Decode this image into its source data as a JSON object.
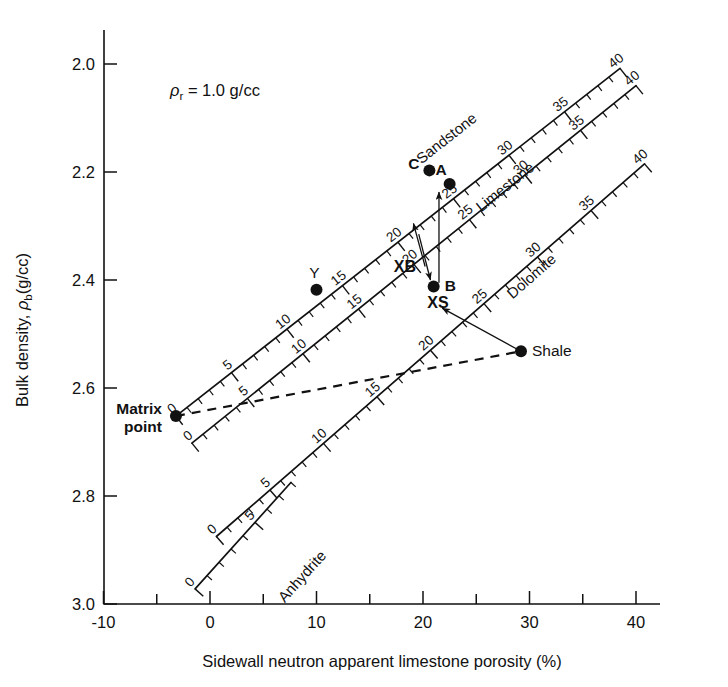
{
  "figure": {
    "domain": "chart",
    "background": "#ffffff",
    "ink_color": "#111111"
  },
  "chart_data": {
    "type": "scatter",
    "title": "",
    "xlabel": "Sidewall neutron apparent limestone porosity (%)",
    "ylabel": "Bulk density, ρb(g/cc)",
    "ylabel_parts": {
      "prefix": "Bulk density, ",
      "rho": "ρ",
      "sub": "b",
      "unit": "(g/cc)"
    },
    "xlim": [
      -10,
      45
    ],
    "ylim": [
      3.0,
      1.93
    ],
    "xticks": [
      -10,
      0,
      10,
      20,
      30,
      40
    ],
    "xtick_labels": [
      "-10",
      "0",
      "10",
      "20",
      "30",
      "40"
    ],
    "xminor_step": 5,
    "yticks": [
      2.0,
      2.2,
      2.4,
      2.6,
      2.8,
      3.0
    ],
    "ytick_labels": [
      "2.0",
      "2.2",
      "2.4",
      "2.6",
      "2.8",
      "3.0"
    ],
    "grid": false,
    "legend": "none",
    "annotations": [
      {
        "id": "fluid-density",
        "text": "ρr = 1.0 g/cc",
        "parts": {
          "rho": "ρ",
          "sub": "r",
          "rest": "= 1.0 g/cc"
        },
        "x": -2.0,
        "y": 2.085
      }
    ],
    "lithology_lines": [
      {
        "name": "Sandstone",
        "label_pos": {
          "x": 22.5,
          "y": 2.145
        },
        "label_rotation": -38,
        "start": {
          "x": -3.2,
          "y": 2.652
        },
        "end": {
          "x": 38.5,
          "y": 2.008
        },
        "scale_min": 0,
        "scale_max": 40,
        "major_step": 5,
        "minor_step": 1,
        "major_labels": [
          0,
          5,
          10,
          15,
          20,
          25,
          30,
          35,
          40
        ]
      },
      {
        "name": "Limestone",
        "label_pos": {
          "x": 28.0,
          "y": 2.235
        },
        "label_rotation": -38,
        "start": {
          "x": -1.7,
          "y": 2.702
        },
        "end": {
          "x": 40.0,
          "y": 2.04
        },
        "scale_min": 0,
        "scale_max": 40,
        "major_step": 5,
        "minor_step": 1,
        "major_labels": [
          0,
          5,
          10,
          15,
          20,
          25,
          30,
          35,
          40
        ]
      },
      {
        "name": "Dolomite",
        "label_pos": {
          "x": 30.5,
          "y": 2.4
        },
        "label_rotation": -38,
        "start": {
          "x": 0.6,
          "y": 2.875
        },
        "end": {
          "x": 40.8,
          "y": 2.185
        },
        "scale_min": 0,
        "scale_max": 40,
        "major_step": 5,
        "minor_step": 1,
        "major_labels": [
          0,
          5,
          10,
          15,
          20,
          25,
          30,
          35,
          40
        ]
      },
      {
        "name": "Anhydrite",
        "label_pos": {
          "x": 9.0,
          "y": 2.955
        },
        "label_rotation": -38,
        "start": {
          "x": -1.4,
          "y": 2.972
        },
        "end": {
          "x": 7.6,
          "y": 2.775
        },
        "scale_min": 0,
        "scale_max": 8,
        "major_step": 5,
        "minor_step": 1,
        "major_labels": [
          0,
          5
        ]
      }
    ],
    "points": [
      {
        "id": "matrix-point",
        "label": "Matrix\npoint",
        "label_line1": "Matrix",
        "label_line2": "point",
        "x": -3.2,
        "y": 2.652,
        "label_side": "left"
      },
      {
        "id": "point-Y",
        "label": "Y",
        "x": 10.0,
        "y": 2.418,
        "label_side": "above"
      },
      {
        "id": "point-C",
        "label": "C",
        "x": 20.6,
        "y": 2.197,
        "label_side": "left"
      },
      {
        "id": "point-A",
        "label": "A",
        "x": 22.5,
        "y": 2.222,
        "label_side": "left-above"
      },
      {
        "id": "point-B",
        "label": "B",
        "x": 21.0,
        "y": 2.412,
        "label_side": "right"
      },
      {
        "id": "point-shale",
        "label": "Shale",
        "x": 29.2,
        "y": 2.532,
        "label_side": "right"
      }
    ],
    "correction_labels": [
      {
        "id": "XB",
        "text": "XB",
        "x": 18.3,
        "y": 2.386
      },
      {
        "id": "XS",
        "text": "XS",
        "x": 21.4,
        "y": 2.452
      }
    ],
    "dashed_lines": [
      {
        "id": "shale-line",
        "from": {
          "x": -3.2,
          "y": 2.652
        },
        "to": {
          "x": 29.2,
          "y": 2.532
        },
        "style": "dashed"
      }
    ],
    "arrows": [
      {
        "id": "arrow-shale-to-B",
        "from": {
          "x": 29.2,
          "y": 2.532
        },
        "to": {
          "x": 21.8,
          "y": 2.452
        },
        "head": "end"
      },
      {
        "id": "arrow-B-up-A",
        "from": {
          "x": 21.5,
          "y": 2.405
        },
        "to": {
          "x": 21.5,
          "y": 2.237
        },
        "head": "end"
      },
      {
        "id": "arrow-XB-down",
        "from": {
          "x": 19.6,
          "y": 2.315
        },
        "to": {
          "x": 20.7,
          "y": 2.4
        },
        "head": "end"
      },
      {
        "id": "arrow-XB-up",
        "from": {
          "x": 20.2,
          "y": 2.375
        },
        "to": {
          "x": 19.1,
          "y": 2.295
        },
        "head": "end"
      }
    ]
  },
  "axes": {
    "x_axis_name": "x-axis",
    "y_axis_name": "y-axis"
  }
}
